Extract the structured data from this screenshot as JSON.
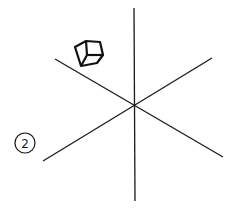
{
  "diagram": {
    "title": "",
    "background": "#ffffff",
    "stroke_color": "#1a1a1a",
    "center": {
      "x": 134,
      "y": 105
    },
    "axes": [
      {
        "name": "vertical-axis",
        "x1": 134,
        "y1": 8,
        "x2": 135,
        "y2": 201
      },
      {
        "name": "diagonal-axis-descending",
        "x1": 55,
        "y1": 59,
        "x2": 223,
        "y2": 157
      },
      {
        "name": "diagonal-axis-ascending",
        "x1": 43,
        "y1": 161,
        "x2": 212,
        "y2": 58
      }
    ],
    "cube_icon": {
      "semantic": "cube-icon",
      "bounds": {
        "x": 73,
        "y": 38,
        "width": 31,
        "height": 28
      }
    },
    "step_label": {
      "semantic": "circled-number",
      "text": "2",
      "cx": 25,
      "cy": 143,
      "r": 10
    }
  }
}
